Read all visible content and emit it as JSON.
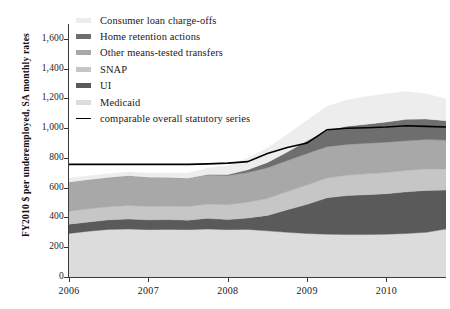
{
  "chart_data": {
    "type": "area",
    "title": "",
    "subtitle": "",
    "xlabel": "",
    "ylabel": "FY2010 $ per underemployed, SA monthly rates",
    "stacked": true,
    "grid": false,
    "legend_position": "top-left",
    "xlim": [
      2006.0,
      2010.75
    ],
    "ylim": [
      0,
      1700
    ],
    "ytick_labels": [
      "0",
      "200",
      "400",
      "600",
      "800",
      "1,000",
      "1,200",
      "1,400",
      "1,600"
    ],
    "ytick_values": [
      0,
      200,
      400,
      600,
      800,
      1000,
      1200,
      1400,
      1600
    ],
    "xtick_labels": [
      "2006",
      "2007",
      "2008",
      "2009",
      "2010"
    ],
    "xtick_values": [
      2006,
      2007,
      2008,
      2009,
      2010
    ],
    "x": [
      2006.0,
      2006.25,
      2006.5,
      2006.75,
      2007.0,
      2007.25,
      2007.5,
      2007.75,
      2008.0,
      2008.25,
      2008.5,
      2008.75,
      2009.0,
      2009.25,
      2009.5,
      2009.75,
      2010.0,
      2010.25,
      2010.5,
      2010.75
    ],
    "series": [
      {
        "name": "Medicaid",
        "color": "#dcdcdc",
        "stack_order": 1,
        "values": [
          293,
          308,
          320,
          322,
          318,
          320,
          318,
          322,
          318,
          320,
          310,
          300,
          292,
          288,
          285,
          285,
          288,
          292,
          300,
          322
        ]
      },
      {
        "name": "UI",
        "color": "#5a5a5a",
        "stack_order": 2,
        "values": [
          62,
          62,
          64,
          68,
          66,
          66,
          64,
          72,
          68,
          76,
          104,
          152,
          196,
          244,
          262,
          268,
          272,
          280,
          282,
          262
        ]
      },
      {
        "name": "SNAP",
        "color": "#c6c6c6",
        "stack_order": 3,
        "values": [
          86,
          88,
          88,
          90,
          90,
          90,
          92,
          96,
          100,
          106,
          114,
          122,
          130,
          134,
          136,
          140,
          142,
          144,
          144,
          142
        ]
      },
      {
        "name": "Other means-tested transfers",
        "color": "#a8a8a8",
        "stack_order": 4,
        "values": [
          196,
          196,
          196,
          200,
          196,
          192,
          190,
          196,
          196,
          200,
          206,
          208,
          212,
          210,
          208,
          206,
          204,
          200,
          198,
          194
        ]
      },
      {
        "name": "Home retention actions",
        "color": "#6e6e6e",
        "stack_order": 5,
        "values": [
          0,
          0,
          0,
          0,
          0,
          0,
          0,
          2,
          6,
          18,
          36,
          58,
          86,
          110,
          122,
          128,
          136,
          144,
          138,
          130
        ]
      },
      {
        "name": "Consumer loan charge-offs",
        "color": "#ededed",
        "stack_order": 6,
        "values": [
          28,
          26,
          26,
          26,
          28,
          30,
          34,
          44,
          60,
          78,
          96,
          118,
          138,
          160,
          176,
          186,
          190,
          186,
          168,
          146
        ]
      }
    ],
    "reference_line": {
      "name": "comparable overall statutory series",
      "color": "#000000",
      "values": [
        757,
        757,
        757,
        757,
        757,
        757,
        757,
        760,
        765,
        775,
        830,
        870,
        900,
        990,
        1000,
        1003,
        1008,
        1016,
        1012,
        1008
      ]
    }
  },
  "axes": {
    "y_title": "FY2010 $ per underemployed, SA monthly rates"
  },
  "legend": {
    "items": [
      {
        "label": "Consumer loan charge-offs",
        "swatch": "#ededed",
        "kind": "swatch"
      },
      {
        "label": "Home retention actions",
        "swatch": "#6e6e6e",
        "kind": "swatch"
      },
      {
        "label": "Other means-tested transfers",
        "swatch": "#a8a8a8",
        "kind": "swatch"
      },
      {
        "label": "SNAP",
        "swatch": "#c6c6c6",
        "kind": "swatch"
      },
      {
        "label": "UI",
        "swatch": "#5a5a5a",
        "kind": "swatch"
      },
      {
        "label": "Medicaid",
        "swatch": "#dcdcdc",
        "kind": "swatch"
      },
      {
        "label": "comparable overall statutory series",
        "swatch": "#000000",
        "kind": "line"
      }
    ]
  }
}
